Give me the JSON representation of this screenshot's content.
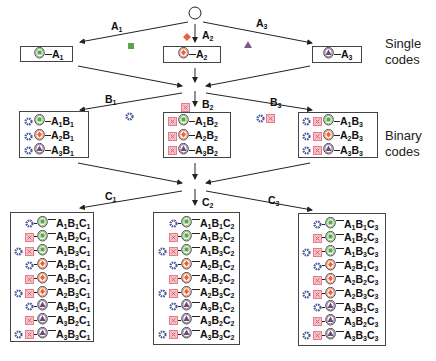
{
  "colors": {
    "green": "#5aa64a",
    "orange": "#e8643a",
    "purple": "#6b4a7a",
    "blue_star": "#4a5a9a",
    "pink_box": "#e87a8a",
    "line": "#222222"
  },
  "side_labels": {
    "single": [
      "Single",
      "codes"
    ],
    "binary": [
      "Binary",
      "codes"
    ]
  },
  "arrow_labels": {
    "a": [
      {
        "base": "A",
        "sub": "1"
      },
      {
        "base": "A",
        "sub": "2"
      },
      {
        "base": "A",
        "sub": "3"
      }
    ],
    "b": [
      {
        "base": "B",
        "sub": "1"
      },
      {
        "base": "B",
        "sub": "2"
      },
      {
        "base": "B",
        "sub": "3"
      }
    ],
    "c": [
      {
        "base": "C",
        "sub": "1"
      },
      {
        "base": "C",
        "sub": "2"
      },
      {
        "base": "C",
        "sub": "3"
      }
    ]
  },
  "icons": {
    "root": "empty-circle",
    "a_markers": [
      "green-square",
      "orange-diamond",
      "purple-triangle"
    ],
    "b_markers": [
      [
        "blue-star"
      ],
      [
        "pink-box"
      ],
      [
        "blue-star",
        "pink-box"
      ]
    ]
  },
  "single_codes": [
    {
      "a": 1,
      "label": [
        [
          "A",
          "1"
        ]
      ]
    },
    {
      "a": 2,
      "label": [
        [
          "A",
          "2"
        ]
      ]
    },
    {
      "a": 3,
      "label": [
        [
          "A",
          "3"
        ]
      ]
    }
  ],
  "binary_codes": [
    {
      "b": 1,
      "rows": [
        {
          "a": 1,
          "label": [
            [
              "A",
              "1"
            ],
            [
              "B",
              "1"
            ]
          ]
        },
        {
          "a": 2,
          "label": [
            [
              "A",
              "2"
            ],
            [
              "B",
              "1"
            ]
          ]
        },
        {
          "a": 3,
          "label": [
            [
              "A",
              "3"
            ],
            [
              "B",
              "1"
            ]
          ]
        }
      ]
    },
    {
      "b": 2,
      "rows": [
        {
          "a": 1,
          "label": [
            [
              "A",
              "1"
            ],
            [
              "B",
              "2"
            ]
          ]
        },
        {
          "a": 2,
          "label": [
            [
              "A",
              "2"
            ],
            [
              "B",
              "2"
            ]
          ]
        },
        {
          "a": 3,
          "label": [
            [
              "A",
              "3"
            ],
            [
              "B",
              "2"
            ]
          ]
        }
      ]
    },
    {
      "b": 3,
      "rows": [
        {
          "a": 1,
          "label": [
            [
              "A",
              "1"
            ],
            [
              "B",
              "3"
            ]
          ]
        },
        {
          "a": 2,
          "label": [
            [
              "A",
              "2"
            ],
            [
              "B",
              "3"
            ]
          ]
        },
        {
          "a": 3,
          "label": [
            [
              "A",
              "3"
            ],
            [
              "B",
              "3"
            ]
          ]
        }
      ]
    }
  ],
  "ternary_codes": [
    {
      "c": 1,
      "rows": [
        {
          "a": 1,
          "b": 1,
          "label": [
            [
              "A",
              "1"
            ],
            [
              "B",
              "1"
            ],
            [
              "C",
              "1"
            ]
          ]
        },
        {
          "a": 1,
          "b": 2,
          "label": [
            [
              "A",
              "1"
            ],
            [
              "B",
              "2"
            ],
            [
              "C",
              "1"
            ]
          ]
        },
        {
          "a": 1,
          "b": 3,
          "label": [
            [
              "A",
              "1"
            ],
            [
              "B",
              "3"
            ],
            [
              "C",
              "1"
            ]
          ]
        },
        {
          "a": 2,
          "b": 1,
          "label": [
            [
              "A",
              "2"
            ],
            [
              "B",
              "1"
            ],
            [
              "C",
              "1"
            ]
          ]
        },
        {
          "a": 2,
          "b": 2,
          "label": [
            [
              "A",
              "2"
            ],
            [
              "B",
              "2"
            ],
            [
              "C",
              "1"
            ]
          ]
        },
        {
          "a": 2,
          "b": 3,
          "label": [
            [
              "A",
              "2"
            ],
            [
              "B",
              "3"
            ],
            [
              "C",
              "1"
            ]
          ]
        },
        {
          "a": 3,
          "b": 1,
          "label": [
            [
              "A",
              "3"
            ],
            [
              "B",
              "1"
            ],
            [
              "C",
              "1"
            ]
          ]
        },
        {
          "a": 3,
          "b": 2,
          "label": [
            [
              "A",
              "3"
            ],
            [
              "B",
              "2"
            ],
            [
              "C",
              "1"
            ]
          ]
        },
        {
          "a": 3,
          "b": 3,
          "label": [
            [
              "A",
              "3"
            ],
            [
              "B",
              "3"
            ],
            [
              "C",
              "1"
            ]
          ]
        }
      ]
    },
    {
      "c": 2,
      "rows": [
        {
          "a": 1,
          "b": 1,
          "label": [
            [
              "A",
              "1"
            ],
            [
              "B",
              "1"
            ],
            [
              "C",
              "2"
            ]
          ]
        },
        {
          "a": 1,
          "b": 2,
          "label": [
            [
              "A",
              "1"
            ],
            [
              "B",
              "2"
            ],
            [
              "C",
              "2"
            ]
          ]
        },
        {
          "a": 1,
          "b": 3,
          "label": [
            [
              "A",
              "1"
            ],
            [
              "B",
              "3"
            ],
            [
              "C",
              "2"
            ]
          ]
        },
        {
          "a": 2,
          "b": 1,
          "label": [
            [
              "A",
              "2"
            ],
            [
              "B",
              "1"
            ],
            [
              "C",
              "2"
            ]
          ]
        },
        {
          "a": 2,
          "b": 2,
          "label": [
            [
              "A",
              "2"
            ],
            [
              "B",
              "2"
            ],
            [
              "C",
              "2"
            ]
          ]
        },
        {
          "a": 2,
          "b": 3,
          "label": [
            [
              "A",
              "2"
            ],
            [
              "B",
              "3"
            ],
            [
              "C",
              "2"
            ]
          ]
        },
        {
          "a": 3,
          "b": 1,
          "label": [
            [
              "A",
              "3"
            ],
            [
              "B",
              "1"
            ],
            [
              "C",
              "2"
            ]
          ]
        },
        {
          "a": 3,
          "b": 2,
          "label": [
            [
              "A",
              "3"
            ],
            [
              "B",
              "2"
            ],
            [
              "C",
              "2"
            ]
          ]
        },
        {
          "a": 3,
          "b": 3,
          "label": [
            [
              "A",
              "3"
            ],
            [
              "B",
              "3"
            ],
            [
              "C",
              "2"
            ]
          ]
        }
      ]
    },
    {
      "c": 3,
      "rows": [
        {
          "a": 1,
          "b": 1,
          "label": [
            [
              "A",
              "1"
            ],
            [
              "B",
              "1"
            ],
            [
              "C",
              "3"
            ]
          ]
        },
        {
          "a": 1,
          "b": 2,
          "label": [
            [
              "A",
              "1"
            ],
            [
              "B",
              "2"
            ],
            [
              "C",
              "3"
            ]
          ]
        },
        {
          "a": 1,
          "b": 3,
          "label": [
            [
              "A",
              "1"
            ],
            [
              "B",
              "3"
            ],
            [
              "C",
              "3"
            ]
          ]
        },
        {
          "a": 2,
          "b": 1,
          "label": [
            [
              "A",
              "2"
            ],
            [
              "B",
              "1"
            ],
            [
              "C",
              "3"
            ]
          ]
        },
        {
          "a": 2,
          "b": 2,
          "label": [
            [
              "A",
              "2"
            ],
            [
              "B",
              "2"
            ],
            [
              "C",
              "3"
            ]
          ]
        },
        {
          "a": 2,
          "b": 3,
          "label": [
            [
              "A",
              "2"
            ],
            [
              "B",
              "3"
            ],
            [
              "C",
              "3"
            ]
          ]
        },
        {
          "a": 3,
          "b": 1,
          "label": [
            [
              "A",
              "3"
            ],
            [
              "B",
              "1"
            ],
            [
              "C",
              "3"
            ]
          ]
        },
        {
          "a": 3,
          "b": 2,
          "label": [
            [
              "A",
              "3"
            ],
            [
              "B",
              "2"
            ],
            [
              "C",
              "3"
            ]
          ]
        },
        {
          "a": 3,
          "b": 3,
          "label": [
            [
              "A",
              "3"
            ],
            [
              "B",
              "3"
            ],
            [
              "C",
              "3"
            ]
          ]
        }
      ]
    }
  ]
}
